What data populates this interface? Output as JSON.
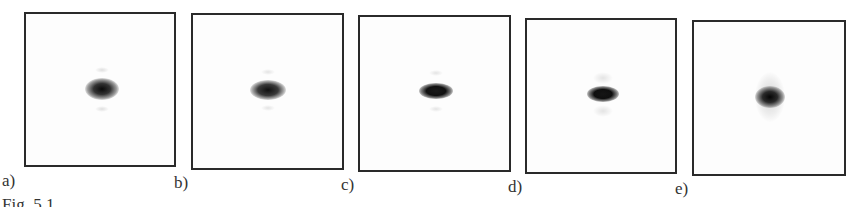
{
  "figure": {
    "caption": "Fig. 5.1",
    "panels": [
      {
        "label": "a)",
        "box": {
          "x": 24,
          "y": 12,
          "w": 152,
          "h": 155
        },
        "spot": {
          "cx": 76,
          "cy": 75,
          "w": 30,
          "h": 20,
          "color": "#111111"
        }
      },
      {
        "label": "b)",
        "box": {
          "x": 191,
          "y": 13,
          "w": 153,
          "h": 157
        },
        "spot": {
          "cx": 75,
          "cy": 75,
          "w": 32,
          "h": 20,
          "color": "#151515"
        }
      },
      {
        "label": "c)",
        "box": {
          "x": 358,
          "y": 15,
          "w": 153,
          "h": 157
        },
        "spot": {
          "cx": 76,
          "cy": 74,
          "w": 32,
          "h": 16,
          "color": "#0f0f0f"
        }
      },
      {
        "label": "d)",
        "box": {
          "x": 525,
          "y": 18,
          "w": 152,
          "h": 156
        },
        "spot": {
          "cx": 76,
          "cy": 74,
          "w": 30,
          "h": 16,
          "color": "#101010"
        }
      },
      {
        "label": "e)",
        "box": {
          "x": 692,
          "y": 20,
          "w": 154,
          "h": 156
        },
        "spot": {
          "cx": 76,
          "cy": 75,
          "w": 28,
          "h": 22,
          "color": "#0d0d0d"
        }
      }
    ],
    "labels_pos": [
      {
        "x": 2,
        "y": 172
      },
      {
        "x": 174,
        "y": 174
      },
      {
        "x": 341,
        "y": 176
      },
      {
        "x": 508,
        "y": 178
      },
      {
        "x": 675,
        "y": 180
      }
    ]
  }
}
